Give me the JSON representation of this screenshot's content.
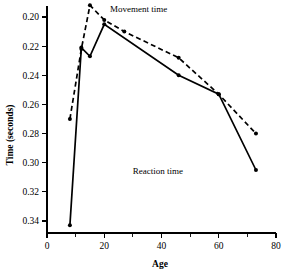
{
  "chart_data": {
    "type": "line",
    "title": "",
    "xlabel": "Age",
    "ylabel": "Time (seconds)",
    "xlim": [
      0,
      80
    ],
    "ylim": [
      0.345,
      0.188
    ],
    "y_inverted": true,
    "grid": false,
    "legend_position": "inline-annotations",
    "x_ticks": [
      0,
      20,
      40,
      60,
      80
    ],
    "x_tick_labels": [
      "0",
      "20",
      "40",
      "60",
      "80"
    ],
    "x_minor_ticks": [
      10,
      30,
      50,
      70
    ],
    "y_ticks": [
      0.2,
      0.22,
      0.24,
      0.26,
      0.28,
      0.3,
      0.32,
      0.34
    ],
    "y_tick_labels": [
      "0.20",
      "0.22",
      "0.24",
      "0.26",
      "0.28",
      "0.30",
      "0.32",
      "0.34"
    ],
    "series": [
      {
        "name": "Movement time",
        "style": "dashed",
        "label": "Movement time",
        "points": [
          {
            "x": 8,
            "y": 0.27
          },
          {
            "x": 12,
            "y": 0.222
          },
          {
            "x": 15,
            "y": 0.192
          },
          {
            "x": 20,
            "y": 0.202
          },
          {
            "x": 27,
            "y": 0.21
          },
          {
            "x": 46,
            "y": 0.228
          },
          {
            "x": 60,
            "y": 0.253
          },
          {
            "x": 73,
            "y": 0.28
          }
        ]
      },
      {
        "name": "Reaction time",
        "style": "solid",
        "label": "Reaction time",
        "points": [
          {
            "x": 8,
            "y": 0.343
          },
          {
            "x": 12,
            "y": 0.221
          },
          {
            "x": 15,
            "y": 0.227
          },
          {
            "x": 20,
            "y": 0.205
          },
          {
            "x": 46,
            "y": 0.24
          },
          {
            "x": 60,
            "y": 0.253
          },
          {
            "x": 73,
            "y": 0.305
          }
        ]
      }
    ],
    "annotations": [
      {
        "text": "Movement time",
        "x_px": 110,
        "y_px": 12
      },
      {
        "text": "Reaction time",
        "x_px": 183,
        "y_px": 174
      }
    ],
    "colors": {
      "ink": "#000000",
      "background": "#ffffff"
    }
  }
}
